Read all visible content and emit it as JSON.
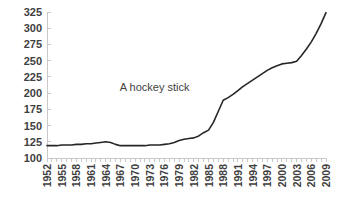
{
  "chart_data": {
    "type": "line",
    "title": "",
    "subtitle": "",
    "xlabel": "",
    "ylabel": "",
    "grid": false,
    "legend": false,
    "legend_position": "none",
    "line_color": "#262626",
    "axis_color": "#c9c9c9",
    "text_color": "#3f3f3f",
    "background": "#ffffff",
    "ylim": [
      100,
      325
    ],
    "ytick_values": [
      100,
      125,
      150,
      175,
      200,
      225,
      250,
      275,
      300,
      325
    ],
    "ytick_labels": [
      "100",
      "125",
      "150",
      "175",
      "200",
      "225",
      "250",
      "275",
      "300",
      "325"
    ],
    "xlim": [
      1952,
      2009
    ],
    "xtick_labels": [
      "1952",
      "1955",
      "1958",
      "1961",
      "1964",
      "1967",
      "1970",
      "1973",
      "1976",
      "1979",
      "1982",
      "1985",
      "1988",
      "1991",
      "1994",
      "1997",
      "2000",
      "2003",
      "2006",
      "2009"
    ],
    "xtick_years": [
      1952,
      1955,
      1958,
      1961,
      1964,
      1967,
      1970,
      1973,
      1976,
      1979,
      1982,
      1985,
      1988,
      1991,
      1994,
      1997,
      2000,
      2003,
      2006,
      2009
    ],
    "x": [
      1952,
      1953,
      1954,
      1955,
      1956,
      1957,
      1958,
      1959,
      1960,
      1961,
      1962,
      1963,
      1964,
      1965,
      1966,
      1967,
      1968,
      1969,
      1970,
      1971,
      1972,
      1973,
      1974,
      1975,
      1976,
      1977,
      1978,
      1979,
      1980,
      1981,
      1982,
      1983,
      1984,
      1985,
      1986,
      1987,
      1988,
      1989,
      1990,
      1991,
      1992,
      1993,
      1994,
      1995,
      1996,
      1997,
      1998,
      1999,
      2000,
      2001,
      2002,
      2003,
      2004,
      2005,
      2006,
      2007,
      2008,
      2009
    ],
    "values": [
      119,
      119,
      119,
      120,
      120,
      120,
      121,
      121,
      122,
      122,
      123,
      124,
      125,
      124,
      121,
      119,
      119,
      119,
      119,
      119,
      119,
      120,
      120,
      120,
      121,
      122,
      124,
      127,
      129,
      130,
      131,
      134,
      139,
      143,
      155,
      172,
      189,
      193,
      198,
      204,
      210,
      215,
      220,
      225,
      230,
      235,
      239,
      242,
      245,
      246,
      247,
      249,
      258,
      268,
      279,
      292,
      307,
      324
    ],
    "annotations": [
      {
        "text": "A hockey stick",
        "x": 1974,
        "y": 203
      }
    ],
    "series": [
      {
        "name": "series-1",
        "values": [
          119,
          119,
          119,
          120,
          120,
          120,
          121,
          121,
          122,
          122,
          123,
          124,
          125,
          124,
          121,
          119,
          119,
          119,
          119,
          119,
          119,
          120,
          120,
          120,
          121,
          122,
          124,
          127,
          129,
          130,
          131,
          134,
          139,
          143,
          155,
          172,
          189,
          193,
          198,
          204,
          210,
          215,
          220,
          225,
          230,
          235,
          239,
          242,
          245,
          246,
          247,
          249,
          258,
          268,
          279,
          292,
          307,
          324
        ]
      }
    ]
  },
  "layout": {
    "plot_left": 47,
    "plot_right": 326,
    "plot_top": 12,
    "plot_bottom": 158
  }
}
